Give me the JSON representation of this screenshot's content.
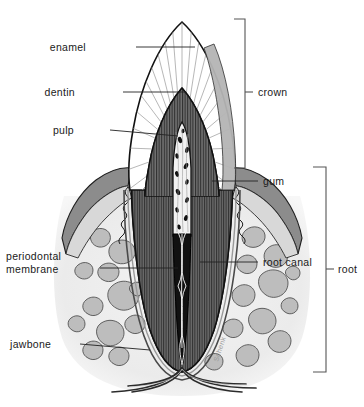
{
  "figure": {
    "signature": "Schenk",
    "width": 364,
    "height": 407
  },
  "labels": {
    "enamel": "enamel",
    "dentin": "dentin",
    "pulp": "pulp",
    "periodontal_line1": "periodontal",
    "periodontal_line2": "membrane",
    "jawbone": "jawbone",
    "gum": "gum",
    "root_canal": "root canal"
  },
  "brackets": {
    "crown": "crown",
    "root": "root"
  },
  "colors": {
    "background": "#ffffff",
    "outline": "#1a1a1a",
    "enamel_fill": "#ffffff",
    "enamel_hatch": "#6f6f6f",
    "dentin_fill": "#6e6e6e",
    "dentin_hatch": "#3a3a3a",
    "crown_shadow": "#b5b5b5",
    "gum_fill": "#8c8c8c",
    "gum_light": "#d8d8d8",
    "bone_field": "#ededed",
    "bone_blob": "#bdbdbd",
    "pulp_fill": "#f2f2f2",
    "canal_fill": "#111111",
    "vessel": "#efefef",
    "label_text": "#1a1a1a",
    "bracket_stroke": "#555555",
    "signature": "#9a9a9a"
  }
}
